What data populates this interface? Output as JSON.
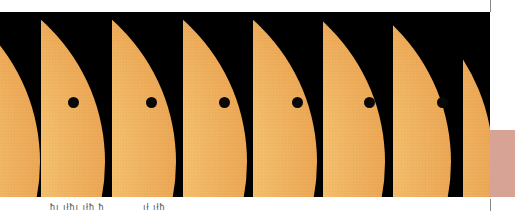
{
  "image": {
    "subject": "Transit of Venus across the Sun - sequence of frames",
    "colors": {
      "sun": "#f4bf6c",
      "sun_limb": "#d98a3a",
      "sky": "#000000",
      "venus": "#0a0806",
      "background": "#ffffff"
    },
    "panels": [
      {
        "left": 0,
        "width": 41,
        "sun_left": -340,
        "venus": null
      },
      {
        "left": 41,
        "width": 71,
        "sun_left": -316,
        "venus": {
          "x": 32,
          "y": 90
        }
      },
      {
        "left": 112,
        "width": 71,
        "sun_left": -316,
        "venus": {
          "x": 39,
          "y": 90
        }
      },
      {
        "left": 183,
        "width": 70,
        "sun_left": -316,
        "venus": {
          "x": 41,
          "y": 90
        }
      },
      {
        "left": 253,
        "width": 70,
        "sun_left": -316,
        "venus": {
          "x": 44,
          "y": 90
        }
      },
      {
        "left": 323,
        "width": 70,
        "sun_left": -318,
        "venus": {
          "x": 46,
          "y": 90
        }
      },
      {
        "left": 393,
        "width": 70,
        "sun_left": -322,
        "venus": {
          "x": 49,
          "y": 90
        }
      },
      {
        "left": 463,
        "width": 27,
        "sun_left": -350,
        "venus": null
      }
    ]
  },
  "captions": [
    {
      "text": "ħı ıłħı ıłħ ħ",
      "left": 50
    },
    {
      "text": "ıł ıłħ",
      "left": 143
    }
  ]
}
